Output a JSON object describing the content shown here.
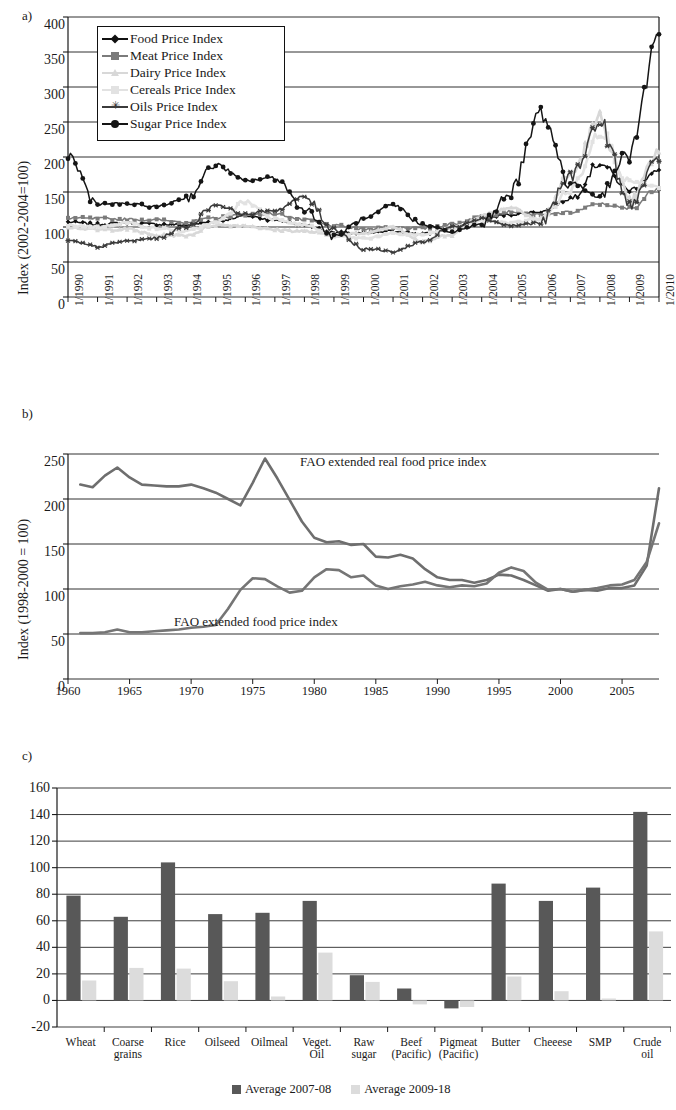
{
  "figure": {
    "panels": [
      "a)",
      "b)",
      "c)"
    ]
  },
  "panel_a": {
    "letter": "a)",
    "ylabel": "Index (2002-2004=100)",
    "yticks": [
      "0",
      "50",
      "100",
      "150",
      "200",
      "250",
      "300",
      "350",
      "400"
    ],
    "xticks": [
      "1/1990",
      "1/1991",
      "1/1992",
      "1/1993",
      "1/1994",
      "1/1995",
      "1/1996",
      "1/1997",
      "1/1998",
      "1/1999",
      "1/2000",
      "1/2001",
      "1/2002",
      "1/2003",
      "1/2004",
      "1/2005",
      "1/2006",
      "1/2007",
      "1/2008",
      "1/2009",
      "1/2010"
    ],
    "legend": [
      {
        "label": "Food Price Index",
        "marker": "diamond",
        "color": "#111111"
      },
      {
        "label": "Meat Price Index",
        "marker": "square",
        "color": "#7b7b7b"
      },
      {
        "label": "Dairy Price Index",
        "marker": "triangle",
        "color": "#d8d8d8"
      },
      {
        "label": "Cereals Price Index",
        "marker": "square",
        "color": "#e2e2e2"
      },
      {
        "label": "Oils Price Index",
        "marker": "asterisk",
        "color": "#3b3b3b"
      },
      {
        "label": "Sugar Price Index",
        "marker": "circle",
        "color": "#151515"
      }
    ]
  },
  "panel_b": {
    "letter": "b)",
    "ylabel": "Index (1998-2000 = 100)",
    "yticks": [
      "0",
      "50",
      "100",
      "150",
      "200",
      "250"
    ],
    "xticks": [
      "1960",
      "1965",
      "1970",
      "1975",
      "1980",
      "1985",
      "1990",
      "1995",
      "2000",
      "2005"
    ],
    "annotations": [
      {
        "text": "FAO extended real food price index"
      },
      {
        "text": "FAO extended food price index"
      }
    ]
  },
  "panel_c": {
    "letter": "c)",
    "yticks": [
      "-20",
      "0",
      "20",
      "40",
      "60",
      "80",
      "100",
      "120",
      "140",
      "160"
    ],
    "legend": [
      {
        "label": "Average 2007-08",
        "color": "#585858"
      },
      {
        "label": "Average 2009-18",
        "color": "#dcdcdc"
      }
    ]
  },
  "chart_data": [
    {
      "type": "line",
      "panel": "a",
      "title": "",
      "xlabel": "",
      "ylabel": "Index (2002-2004=100)",
      "ylim": [
        0,
        400
      ],
      "ytick_step": 50,
      "grid": true,
      "legend_position": "top-left-inside",
      "x": [
        "1/1990",
        "1/1991",
        "1/1992",
        "1/1993",
        "1/1994",
        "1/1995",
        "1/1996",
        "1/1997",
        "1/1998",
        "1/1999",
        "1/2000",
        "1/2001",
        "1/2002",
        "1/2003",
        "1/2004",
        "1/2005",
        "1/2006",
        "1/2007",
        "1/2008",
        "1/2009",
        "1/2010"
      ],
      "series": [
        {
          "name": "Food Price Index",
          "marker": "diamond",
          "color": "#111111",
          "values": [
            107,
            104,
            106,
            104,
            103,
            108,
            116,
            110,
            103,
            92,
            91,
            94,
            90,
            98,
            112,
            118,
            122,
            140,
            191,
            153,
            180
          ]
        },
        {
          "name": "Meat Price Index",
          "marker": "square",
          "color": "#7b7b7b",
          "values": [
            113,
            112,
            111,
            110,
            107,
            113,
            118,
            119,
            110,
            102,
            97,
            100,
            98,
            104,
            115,
            122,
            117,
            121,
            133,
            126,
            156
          ]
        },
        {
          "name": "Dairy Price Index",
          "marker": "triangle",
          "color": "#d8d8d8",
          "values": [
            100,
            96,
            97,
            88,
            88,
            103,
            102,
            96,
            94,
            88,
            91,
            101,
            79,
            90,
            117,
            128,
            110,
            175,
            253,
            135,
            206
          ]
        },
        {
          "name": "Cereals Price Index",
          "marker": "square",
          "color": "#e2e2e2",
          "values": [
            102,
            100,
            106,
            98,
            94,
            106,
            136,
            112,
            103,
            88,
            84,
            90,
            89,
            98,
            109,
            106,
            112,
            152,
            238,
            165,
            157
          ]
        },
        {
          "name": "Oils Price Index",
          "marker": "asterisk",
          "color": "#3b3b3b",
          "values": [
            80,
            72,
            80,
            84,
            101,
            132,
            118,
            124,
            143,
            97,
            69,
            65,
            79,
            100,
            112,
            102,
            106,
            172,
            248,
            132,
            195
          ]
        },
        {
          "name": "Sugar Price Index",
          "marker": "circle",
          "color": "#151515",
          "values": [
            202,
            133,
            133,
            129,
            141,
            189,
            166,
            171,
            126,
            86,
            111,
            131,
            104,
            93,
            104,
            151,
            264,
            163,
            144,
            210,
            375
          ]
        }
      ],
      "notes": "Monthly FAO price indices 1/1990–12/2010; sugar peaks ~264 in early 2006 and ~375 in early 2010; food index peaks ~191 in mid-2008."
    },
    {
      "type": "line",
      "panel": "b",
      "title": "",
      "xlabel": "",
      "ylabel": "Index (1998-2000 = 100)",
      "ylim": [
        0,
        250
      ],
      "ytick_step": 50,
      "xlim": [
        1960,
        2008
      ],
      "xtick_step": 5,
      "grid": true,
      "legend_position": "inline-annotations",
      "x": [
        1961,
        1962,
        1963,
        1964,
        1965,
        1966,
        1967,
        1968,
        1969,
        1970,
        1971,
        1972,
        1973,
        1974,
        1975,
        1976,
        1977,
        1978,
        1979,
        1980,
        1981,
        1982,
        1983,
        1984,
        1985,
        1986,
        1987,
        1988,
        1989,
        1990,
        1991,
        1992,
        1993,
        1994,
        1995,
        1996,
        1997,
        1998,
        1999,
        2000,
        2001,
        2002,
        2003,
        2004,
        2005,
        2006,
        2007,
        2008
      ],
      "series": [
        {
          "name": "FAO extended real food price index",
          "color": "#6e6e6e",
          "values": [
            216,
            213,
            226,
            235,
            224,
            216,
            215,
            214,
            214,
            216,
            212,
            207,
            200,
            193,
            218,
            245,
            223,
            199,
            175,
            157,
            152,
            153,
            149,
            150,
            136,
            135,
            138,
            134,
            122,
            113,
            110,
            110,
            107,
            110,
            116,
            115,
            110,
            104,
            98,
            100,
            97,
            99,
            98,
            101,
            101,
            104,
            126,
            212
          ]
        },
        {
          "name": "FAO extended food price index",
          "color": "#757575",
          "values": [
            51,
            51,
            52,
            55,
            52,
            52,
            53,
            54,
            55,
            57,
            58,
            60,
            78,
            99,
            112,
            111,
            103,
            96,
            98,
            113,
            122,
            121,
            113,
            115,
            104,
            100,
            103,
            105,
            108,
            104,
            102,
            104,
            103,
            106,
            118,
            124,
            120,
            107,
            99,
            100,
            97,
            99,
            101,
            104,
            105,
            110,
            130,
            173
          ]
        }
      ],
      "notes": "Two lines: real index starts ~216 in 1961, peaks ~245 in 1974-75, declines to ~100 by 2000, rises to ~212 by 2008. Nominal index starts ~51, rises to ~112 in 1975, stays 100-125, rises to ~173 by 2008."
    },
    {
      "type": "bar",
      "panel": "c",
      "title": "",
      "xlabel": "",
      "ylabel": "",
      "ylim": [
        -20,
        160
      ],
      "ytick_step": 20,
      "grid": true,
      "legend_position": "bottom",
      "categories": [
        "Wheat",
        "Coarse grains",
        "Rice",
        "Oilseed",
        "Oilmeal",
        "Veget. Oil",
        "Raw sugar",
        "Beef (Pacific)",
        "Pigmeat (Pacific)",
        "Butter",
        "Cheeese",
        "SMP",
        "Crude oil"
      ],
      "series": [
        {
          "name": "Average 2007-08",
          "color": "#585858",
          "values": [
            79,
            63,
            104,
            65,
            66,
            75,
            19,
            9,
            -6,
            88,
            75,
            85,
            142
          ]
        },
        {
          "name": "Average 2009-18",
          "color": "#dcdcdc",
          "values": [
            15,
            24.5,
            24,
            14.5,
            3,
            36,
            14,
            -3,
            -5,
            18,
            7,
            1.5,
            52
          ]
        }
      ],
      "notes": "Percent deviations; Beef(Pacific) 2009-18 and both Pigmeat(Pacific) bars are negative."
    }
  ]
}
